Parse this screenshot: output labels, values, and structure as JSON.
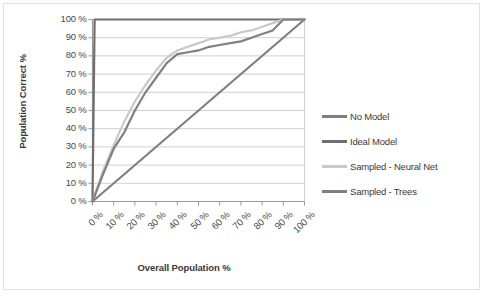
{
  "chart_data": {
    "type": "line",
    "title": "",
    "xlabel": "Overall Population %",
    "ylabel": "Population Correct %",
    "xlim": [
      0,
      100
    ],
    "ylim": [
      0,
      100
    ],
    "grid": true,
    "legend_position": "right",
    "xticks": [
      "0 %",
      "10 %",
      "20 %",
      "30 %",
      "40 %",
      "50 %",
      "60 %",
      "70 %",
      "80 %",
      "90 %",
      "100 %"
    ],
    "yticks": [
      "0 %",
      "10 %",
      "20 %",
      "30 %",
      "40 %",
      "50 %",
      "60 %",
      "70 %",
      "80 %",
      "90 %",
      "100 %"
    ],
    "x": [
      0,
      5,
      10,
      15,
      20,
      25,
      30,
      35,
      40,
      45,
      50,
      55,
      60,
      65,
      70,
      75,
      80,
      85,
      90,
      95,
      100
    ],
    "series": [
      {
        "name": "No Model",
        "color": "#7f7f7f",
        "x": [
          0,
          100
        ],
        "values": [
          0,
          100
        ]
      },
      {
        "name": "Ideal Model",
        "color": "#6e6e6e",
        "x": [
          0,
          1,
          100
        ],
        "values": [
          0,
          100,
          100
        ]
      },
      {
        "name": "Sampled - Neural Net",
        "color": "#c9c9c9",
        "x": [
          0,
          5,
          10,
          15,
          20,
          25,
          30,
          35,
          40,
          45,
          50,
          55,
          60,
          65,
          70,
          75,
          80,
          85,
          90,
          95,
          100
        ],
        "values": [
          0,
          17,
          31,
          44,
          55,
          64,
          72,
          79,
          83,
          85,
          87,
          89,
          90,
          91,
          93,
          94,
          96,
          98,
          100,
          100,
          100
        ]
      },
      {
        "name": "Sampled - Trees",
        "color": "#808080",
        "x": [
          0,
          5,
          10,
          15,
          20,
          25,
          30,
          35,
          40,
          45,
          50,
          55,
          60,
          65,
          70,
          75,
          80,
          85,
          90,
          95,
          100
        ],
        "values": [
          0,
          15,
          29,
          38,
          50,
          60,
          68,
          76,
          81,
          82,
          83,
          85,
          86,
          87,
          88,
          90,
          92,
          94,
          100,
          100,
          100
        ]
      }
    ]
  },
  "legend": {
    "items": [
      {
        "label": "No Model",
        "color": "#7f7f7f"
      },
      {
        "label": "Ideal Model",
        "color": "#6e6e6e"
      },
      {
        "label": "Sampled - Neural Net",
        "color": "#c9c9c9"
      },
      {
        "label": "Sampled - Trees",
        "color": "#808080"
      }
    ]
  },
  "axes": {
    "y_title": "Population Correct %",
    "x_title": "Overall Population %"
  }
}
